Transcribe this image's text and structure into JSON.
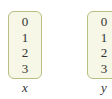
{
  "arrays": [
    {
      "name": "x",
      "values": [
        "0",
        "1",
        "2",
        "3"
      ]
    },
    {
      "name": "y",
      "values": [
        "0",
        "1",
        "2",
        "3"
      ]
    }
  ],
  "colors": {
    "box_border": "#b9bf82",
    "box_fill": "#f6f7e6",
    "text": "#333333"
  }
}
